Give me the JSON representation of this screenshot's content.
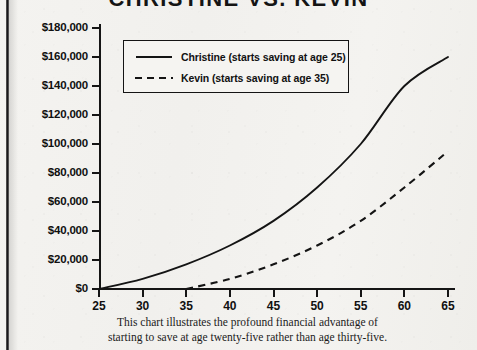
{
  "page": {
    "title": "CHRISTINE VS. KEVIN",
    "background_color": "#f3f2ef",
    "ink_color": "#141414"
  },
  "caption": {
    "line1": "This chart illustrates the profound financial advantage of",
    "line2": "starting to save at age twenty-five rather than age thirty-five."
  },
  "legend": {
    "position": "inside-top-left",
    "entries": [
      {
        "label": "Christine (starts saving at age 25)",
        "style": "solid"
      },
      {
        "label": "Kevin (starts saving at age 35)",
        "style": "dashed"
      }
    ]
  },
  "axes": {
    "y_ticks": [
      "$180,000",
      "$160,000",
      "$140,000",
      "$120,000",
      "$100,000",
      "$80,000",
      "$60,000",
      "$40,000",
      "$20,000",
      "$0"
    ],
    "x_ticks": [
      "25",
      "30",
      "35",
      "40",
      "45",
      "50",
      "55",
      "60",
      "65"
    ]
  },
  "chart_data": {
    "type": "line",
    "title": "CHRISTINE VS. KEVIN",
    "xlabel": "",
    "ylabel": "",
    "xlim": [
      25,
      65
    ],
    "ylim": [
      0,
      180000
    ],
    "grid": false,
    "legend_position": "upper left (inset box)",
    "x": [
      25,
      30,
      35,
      40,
      45,
      50,
      55,
      60,
      65
    ],
    "series": [
      {
        "name": "Christine (starts saving at age 25)",
        "style": "solid",
        "values": [
          0,
          7000,
          17000,
          30000,
          47000,
          70000,
          100000,
          140000,
          160000
        ]
      },
      {
        "name": "Kevin (starts saving at age 35)",
        "style": "dashed",
        "values": [
          null,
          null,
          0,
          7000,
          17000,
          30000,
          47000,
          70000,
          95000
        ]
      }
    ],
    "annotations": [
      "This chart illustrates the profound financial advantage of starting to save at age twenty-five rather than age thirty-five."
    ]
  }
}
